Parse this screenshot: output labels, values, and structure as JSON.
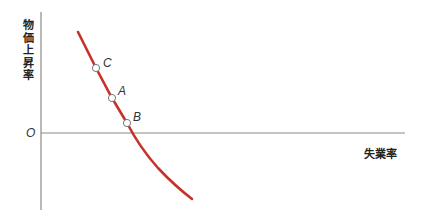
{
  "diagram": {
    "type": "phillips-curve",
    "y_axis_label_chars": [
      "物",
      "価",
      "上",
      "昇",
      "率"
    ],
    "y_axis_label": "物価上昇率",
    "x_axis_label": "失業率",
    "origin_label": "O",
    "curve_color": "#c8312b",
    "axis_color": "#8a8a8a",
    "points": [
      {
        "label": "C",
        "x": 96,
        "y": 68,
        "label_x": 102,
        "label_y": 55
      },
      {
        "label": "A",
        "x": 112,
        "y": 98,
        "label_x": 118,
        "label_y": 84
      },
      {
        "label": "B",
        "x": 127,
        "y": 123,
        "label_x": 133,
        "label_y": 109
      }
    ]
  }
}
